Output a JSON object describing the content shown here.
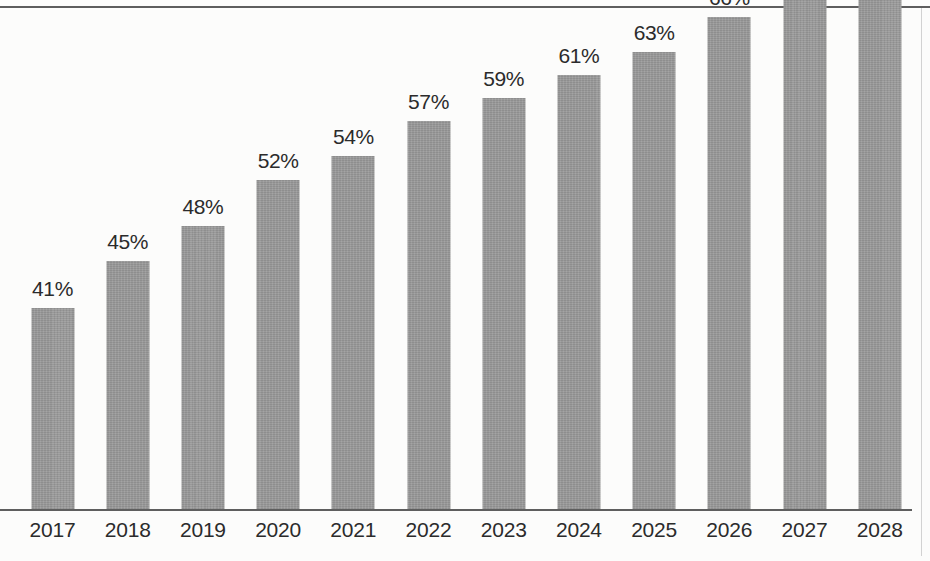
{
  "chart_data": {
    "type": "bar",
    "title": "",
    "subtitle": "",
    "xlabel": "",
    "ylabel": "",
    "categories": [
      "2017",
      "2018",
      "2019",
      "2020",
      "2021",
      "2022",
      "2023",
      "2024",
      "2025",
      "2026",
      "2027",
      "2028"
    ],
    "values": [
      41,
      45,
      48,
      52,
      54,
      57,
      59,
      61,
      63,
      66,
      68,
      70
    ],
    "value_labels": [
      "41%",
      "45%",
      "48%",
      "52%",
      "54%",
      "57%",
      "59%",
      "61%",
      "63%",
      "66%",
      "68%",
      "70%"
    ],
    "unit": "%",
    "ylim": [
      23.6,
      62.1
    ],
    "grid": false,
    "legend": null,
    "legend_position": "none",
    "y_axis_visible": false,
    "value_labels_visible": true,
    "bar_color": "#9a9a9a",
    "label_color": "#2b2b2b",
    "axis_color": "#5e5e5e",
    "background_color": "#fcfcfb"
  }
}
